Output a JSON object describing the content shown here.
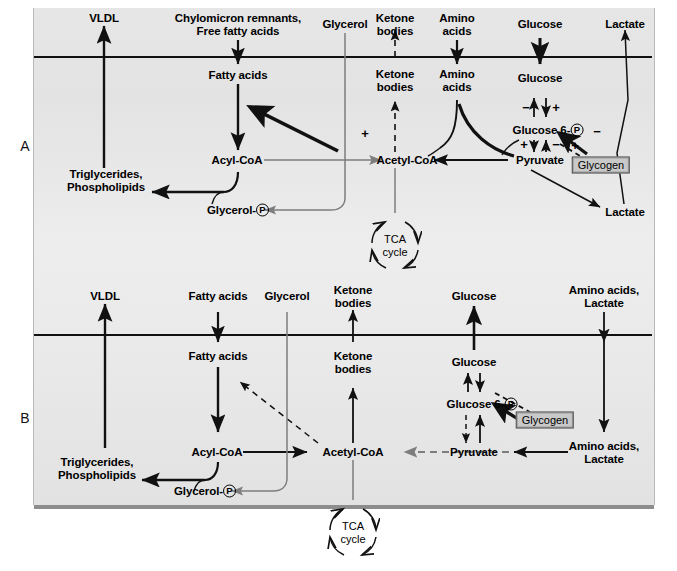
{
  "figure": {
    "panels": [
      {
        "letter": "A",
        "state": "fed",
        "extracellular_labels": [
          "VLDL",
          "Chylomicron remnants,\nFree fatty acids",
          "Glycerol",
          "Ketone\nbodies",
          "Amino\nacids",
          "Glucose",
          "Lactate"
        ],
        "intracellular_labels": [
          "Fatty acids",
          "Ketone\nbodies",
          "Amino\nacids",
          "Glucose",
          "Glucose 6-P",
          "Acyl-CoA",
          "Acetyl-CoA",
          "Pyruvate",
          "Triglycerides,\nPhospholipids",
          "Glycerol-P",
          "Lactate",
          "Glycogen",
          "TCA\ncycle"
        ],
        "regulatory_signs": [
          "−",
          "+",
          "+",
          "−",
          "+",
          "+",
          "−",
          "−"
        ]
      },
      {
        "letter": "B",
        "state": "fasting",
        "extracellular_labels": [
          "VLDL",
          "Fatty acids",
          "Glycerol",
          "Ketone\nbodies",
          "Glucose",
          "Amino acids,\nLactate"
        ],
        "intracellular_labels": [
          "Fatty acids",
          "Ketone\nbodies",
          "Glucose",
          "Glucose 6-P",
          "Acyl-CoA",
          "Acetyl-CoA",
          "Pyruvate",
          "Triglycerides,\nPhospholipids",
          "Glycerol-P",
          "Amino acids,\nLactate",
          "Glycogen",
          "TCA\ncycle"
        ],
        "regulatory_signs": []
      }
    ],
    "nodes_A": {
      "vldl": "VLDL",
      "chylo": "Chylomicron remnants,\nFree fatty acids",
      "glycerol_out": "Glycerol",
      "ketone_out": "Ketone\nbodies",
      "amino_out": "Amino\nacids",
      "glucose_out": "Glucose",
      "lactate_out": "Lactate",
      "fatty_acids": "Fatty acids",
      "ketone_in": "Ketone\nbodies",
      "amino_in": "Amino\nacids",
      "glucose_in": "Glucose",
      "g6p_pre": "Glucose 6-",
      "g6p_p": "P",
      "acyl_coa": "Acyl-CoA",
      "acetyl_coa": "Acetyl-CoA",
      "pyruvate": "Pyruvate",
      "tg_pl": "Triglycerides,\nPhospholipids",
      "glycerolp_pre": "Glycerol-",
      "glycerolp_p": "P",
      "lactate_in": "Lactate",
      "glycogen": "Glycogen",
      "tca": "TCA\ncycle",
      "sign_minus_1": "−",
      "sign_plus_1": "+",
      "sign_plus_2": "+",
      "sign_minus_2": "−",
      "sign_plus_3": "+",
      "sign_plus_4": "+",
      "sign_minus_3": "−",
      "sign_plus_acetyl": "+"
    },
    "nodes_B": {
      "vldl": "VLDL",
      "fatty_acids_out": "Fatty acids",
      "glycerol_out": "Glycerol",
      "ketone_out": "Ketone\nbodies",
      "glucose_out": "Glucose",
      "aa_lactate_out": "Amino acids,\nLactate",
      "fatty_acids": "Fatty acids",
      "ketone_in": "Ketone\nbodies",
      "glucose_in": "Glucose",
      "g6p_pre": "Glucose 6-",
      "g6p_p": "P",
      "acyl_coa": "Acyl-CoA",
      "acetyl_coa": "Acetyl-CoA",
      "pyruvate": "Pyruvate",
      "tg_pl": "Triglycerides,\nPhospholipids",
      "glycerolp_pre": "Glycerol-",
      "glycerolp_p": "P",
      "aa_lactate_in": "Amino acids,\nLactate",
      "glycogen": "Glycogen",
      "tca": "TCA\ncycle"
    },
    "panel_labels": {
      "a": "A",
      "b": "B"
    },
    "colors": {
      "arrow_black": "#111111",
      "arrow_gray": "#7d7d7d",
      "membrane": "#111111",
      "glycogen_fill": "#c9c9c9",
      "background": "#e9e9e9",
      "page": "#ffffff"
    }
  }
}
